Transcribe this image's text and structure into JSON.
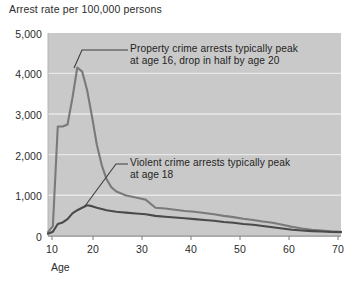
{
  "chart_data": {
    "type": "line",
    "title": "Arrest rate per 100,000 persons",
    "xlabel": "Age",
    "ylabel": "Arrest rate per 100,000 persons",
    "xlim": [
      10,
      70
    ],
    "ylim": [
      0,
      5000
    ],
    "grid": true,
    "legend": "none (series labeled by annotations)",
    "x_ticks": [
      "10",
      "20",
      "30",
      "40",
      "50",
      "60",
      "70"
    ],
    "x_tick_values": [
      10,
      20,
      30,
      40,
      50,
      60,
      70
    ],
    "y_ticks": [
      "0",
      "1,000",
      "2,000",
      "3,000",
      "4,000",
      "5,000"
    ],
    "y_tick_values": [
      0,
      1000,
      2000,
      3000,
      4000,
      5000
    ],
    "x": [
      10,
      11,
      12,
      13,
      14,
      15,
      16,
      17,
      18,
      19,
      20,
      21,
      22,
      23,
      24,
      25,
      26,
      28,
      30,
      32,
      34,
      36,
      38,
      40,
      42,
      44,
      46,
      48,
      50,
      52,
      54,
      56,
      58,
      60,
      62,
      64,
      66,
      68,
      70
    ],
    "series": [
      {
        "name": "Property crime arrests",
        "color": "#7a7a7a",
        "values": [
          100,
          250,
          2700,
          2700,
          2750,
          3400,
          4150,
          4050,
          3600,
          2950,
          2250,
          1750,
          1400,
          1200,
          1100,
          1050,
          1000,
          950,
          900,
          700,
          680,
          650,
          620,
          600,
          570,
          540,
          500,
          470,
          430,
          400,
          360,
          330,
          280,
          230,
          190,
          160,
          140,
          120,
          110
        ]
      },
      {
        "name": "Violent crime arrests",
        "color": "#4a4a4a",
        "values": [
          60,
          110,
          300,
          340,
          420,
          560,
          640,
          700,
          760,
          740,
          700,
          670,
          640,
          620,
          600,
          590,
          580,
          560,
          540,
          500,
          480,
          460,
          440,
          420,
          400,
          380,
          350,
          330,
          300,
          280,
          250,
          220,
          190,
          160,
          140,
          125,
          115,
          105,
          100
        ]
      }
    ],
    "annotations": [
      {
        "name": "property-peak-note",
        "line1": "Property crime arrests typically peak",
        "line2": "at age 16, drop in half by age 20",
        "points_to_age": 16
      },
      {
        "name": "violent-peak-note",
        "line1": "Violent crime arrests typically peak",
        "line2": "at age 18",
        "points_to_age": 18
      }
    ],
    "colors": {
      "plot_background": "#c9c9c9",
      "page_background": "#ffffff",
      "gridline": "#e6e6e6",
      "property_line": "#7a7a7a",
      "violent_line": "#4a4a4a",
      "axis_line": "#8c8c8c",
      "text": "#262626"
    }
  }
}
